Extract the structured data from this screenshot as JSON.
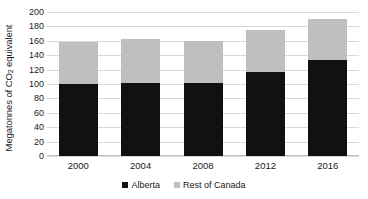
{
  "chart_data": {
    "type": "bar",
    "subtype": "stacked-column",
    "title": "",
    "xlabel": "",
    "ylabel": "Megatonnes of CO2 equivalent",
    "ylabel_parts": {
      "before": "Megatonnes of CO",
      "sub": "2",
      "after": " equivalent"
    },
    "categories": [
      "2000",
      "2004",
      "2008",
      "2012",
      "2016"
    ],
    "series": [
      {
        "name": "Alberta",
        "color": "#111111",
        "values": [
          100,
          102,
          102,
          117,
          133
        ]
      },
      {
        "name": "Rest of Canada",
        "color": "#BFBFBF",
        "values": [
          59,
          61,
          58,
          58,
          57
        ]
      }
    ],
    "totals": [
      159,
      163,
      160,
      175,
      190
    ],
    "ylim": [
      0,
      200
    ],
    "yticks": [
      0,
      20,
      40,
      60,
      80,
      100,
      120,
      140,
      160,
      180,
      200
    ],
    "ytick_labels": [
      "0",
      "20",
      "40",
      "60",
      "80",
      "100",
      "120",
      "140",
      "160",
      "180",
      "200"
    ],
    "grid": true,
    "grid_color": "#D9D9D9",
    "legend_position": "bottom",
    "background": "#FFFFFF"
  },
  "legend": {
    "items": [
      {
        "label": "Alberta",
        "swatch": "alberta"
      },
      {
        "label": "Rest of Canada",
        "swatch": "rest"
      }
    ]
  }
}
